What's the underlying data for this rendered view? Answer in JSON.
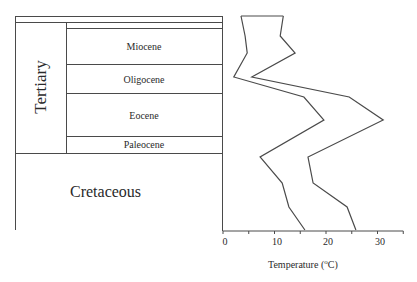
{
  "stratigraphy": {
    "periods": [
      {
        "name": "Tertiary",
        "orientation": "vertical"
      },
      {
        "name": "Cretaceous",
        "orientation": "horizontal"
      }
    ],
    "epochs": [
      {
        "name": "Miocene"
      },
      {
        "name": "Oligocene"
      },
      {
        "name": "Eocene"
      },
      {
        "name": "Paleocene"
      }
    ]
  },
  "chart_data": {
    "type": "line",
    "title": "",
    "xlabel": "Temperature (°C)",
    "xlabel_parts": {
      "prefix": "Temperature (",
      "sup": "o",
      "suffix": "C)"
    },
    "ylabel": "",
    "xlim": [
      0,
      35
    ],
    "xticks": [
      0,
      5,
      10,
      15,
      20,
      25,
      30,
      35
    ],
    "xtick_labels": [
      "0",
      "10",
      "20",
      "30"
    ],
    "grid": false,
    "legend": null,
    "y_axis": "geologic time (top = youngest), aligned with stratigraphic column",
    "y_positions_px": [
      16,
      36,
      53,
      77,
      97,
      120,
      157,
      183,
      207,
      230
    ],
    "series": [
      {
        "name": "lower bound",
        "values": [
          3.5,
          4.3,
          4.7,
          2.1,
          15.7,
          19.6,
          7.2,
          11.5,
          12.8,
          15.9
        ]
      },
      {
        "name": "upper bound",
        "values": [
          11.7,
          11.1,
          14.0,
          5.6,
          24.5,
          31.1,
          16.5,
          17.5,
          24.1,
          25.8
        ]
      }
    ]
  }
}
